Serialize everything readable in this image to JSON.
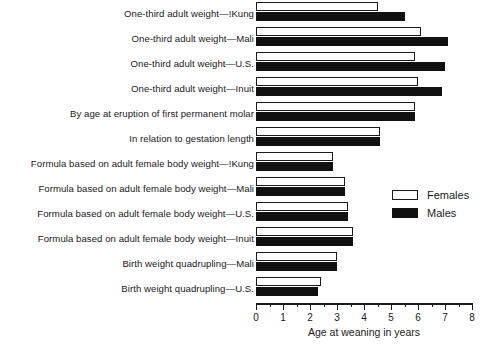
{
  "chart_data": {
    "type": "bar",
    "orientation": "horizontal",
    "title": "",
    "xlabel": "Age at weaning in years",
    "ylabel": "",
    "xlim": [
      0,
      8
    ],
    "xticks": [
      0,
      1,
      2,
      3,
      4,
      5,
      6,
      7,
      8
    ],
    "xtick_labels": [
      "0",
      "1",
      "2",
      "3",
      "4",
      "5",
      "6",
      "7",
      "8"
    ],
    "minor_tick_interval": 0.5,
    "grid": false,
    "legend_position": "middle-right",
    "categories": [
      "One-third adult weight—!Kung",
      "One-third adult weight—Mali",
      "One-third adult weight—U.S.",
      "One-third adult weight—Inuit",
      "By age at eruption of first permanent molar",
      "In relation to gestation length",
      "Formula based on adult female body weight—!Kung",
      "Formula based on adult female body weight—Mali",
      "Formula based on adult female body weight—U.S.",
      "Formula based on adult female body weight—Inuit",
      "Birth weight quadrupling—Mali",
      "Birth weight quadrupling—U.S."
    ],
    "series": [
      {
        "name": "Females",
        "color": "#ffffff",
        "values": [
          4.5,
          6.1,
          5.9,
          6.0,
          5.9,
          4.6,
          2.85,
          3.3,
          3.4,
          3.6,
          3.0,
          2.4
        ]
      },
      {
        "name": "Males",
        "color": "#111111",
        "values": [
          5.5,
          7.1,
          7.0,
          6.9,
          5.9,
          4.6,
          2.85,
          3.3,
          3.4,
          3.6,
          3.0,
          2.3
        ]
      }
    ]
  },
  "legend": {
    "items": [
      {
        "label": "Females",
        "swatch": "female"
      },
      {
        "label": "Males",
        "swatch": "male"
      }
    ]
  }
}
